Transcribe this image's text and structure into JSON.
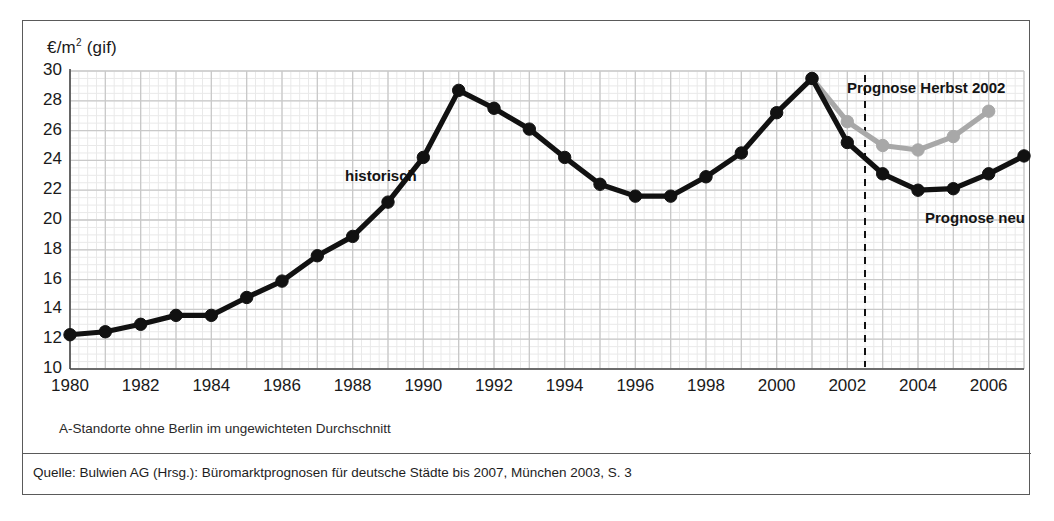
{
  "figure": {
    "unit_label_main": "€/m",
    "unit_label_sup": "2",
    "unit_label_tail": " (gif)",
    "note": "A-Standorte ohne Berlin im ungewichteten Durchschnitt",
    "source": "Quelle: Bulwien AG (Hrsg.): Büromarktprognosen für deutsche Städte bis 2007, München 2003, S. 3",
    "colors": {
      "historic": "#111111",
      "forecast_old": "#a8a8a8",
      "grid_major": "#c9c9c9",
      "grid_minor": "#e9e9e9",
      "axis": "#4a4a4a",
      "frame": "#5a5a5a",
      "text": "#1a1a1a"
    }
  },
  "annotations": [
    {
      "name": "historisch",
      "text": "historisch",
      "x": 322,
      "y": 146
    },
    {
      "name": "prognose-herbst-2002",
      "text": "Prognose Herbst 2002",
      "x": 824,
      "y": 58
    },
    {
      "name": "prognose-neu",
      "text": "Prognose neu",
      "x": 902,
      "y": 188
    }
  ],
  "chart_data": {
    "type": "line",
    "title": "",
    "subtitle": "",
    "xlabel": "",
    "ylabel": "€/m² (gif)",
    "xlim": [
      1980,
      2007
    ],
    "ylim": [
      10,
      30
    ],
    "ytick_step": 2,
    "xtick_step": 2,
    "grid": true,
    "minor_grid": true,
    "legend_position": "inline-annotation",
    "yticks": [
      10,
      12,
      14,
      16,
      18,
      20,
      22,
      24,
      26,
      28,
      30
    ],
    "xticks": [
      1980,
      1982,
      1984,
      1986,
      1988,
      1990,
      1992,
      1994,
      1996,
      1998,
      2000,
      2002,
      2004,
      2006
    ],
    "forecast_divider_x": 2002.5,
    "x": [
      1980,
      1981,
      1982,
      1983,
      1984,
      1985,
      1986,
      1987,
      1988,
      1989,
      1990,
      1991,
      1992,
      1993,
      1994,
      1995,
      1996,
      1997,
      1998,
      1999,
      2000,
      2001,
      2002,
      2003,
      2004,
      2005,
      2006,
      2007
    ],
    "series": [
      {
        "name": "historisch / Prognose neu",
        "label": "historisch",
        "color": "#111111",
        "x": [
          1980,
          1981,
          1982,
          1983,
          1984,
          1985,
          1986,
          1987,
          1988,
          1989,
          1990,
          1991,
          1992,
          1993,
          1994,
          1995,
          1996,
          1997,
          1998,
          1999,
          2000,
          2001,
          2002,
          2003,
          2004,
          2005,
          2006,
          2007
        ],
        "values": [
          12.3,
          12.5,
          13.0,
          13.6,
          13.6,
          14.8,
          15.9,
          17.6,
          18.9,
          21.2,
          24.2,
          28.7,
          27.5,
          26.1,
          24.2,
          22.4,
          21.6,
          21.6,
          22.9,
          24.5,
          27.2,
          29.5,
          25.2,
          23.1,
          22.0,
          22.1,
          23.1,
          24.3
        ]
      },
      {
        "name": "Prognose Herbst 2002",
        "label": "Prognose Herbst 2002",
        "color": "#a8a8a8",
        "x": [
          2001,
          2002,
          2003,
          2004,
          2005,
          2006
        ],
        "values": [
          29.5,
          26.6,
          25.0,
          24.7,
          25.6,
          27.3
        ]
      }
    ]
  }
}
